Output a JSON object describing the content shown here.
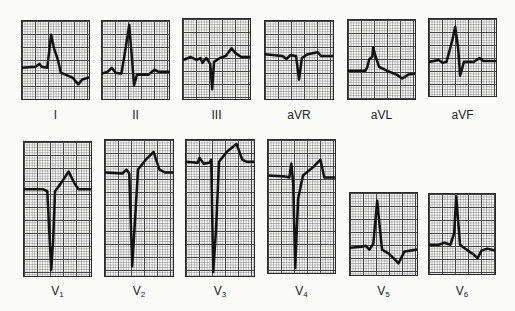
{
  "figure": {
    "trace_color": "#111111",
    "grid_color": "#444444"
  },
  "leads": [
    {
      "id": "I",
      "label": "I",
      "sub": "",
      "box": [
        21,
        20,
        69,
        80
      ],
      "label_y": 108,
      "trace": "0,48 14,47 18,44 20,47 26,48 30,14 33,28 37,40 40,53 52,58 58,65 62,60 69,58"
    },
    {
      "id": "II",
      "label": "II",
      "sub": "",
      "box": [
        101,
        20,
        69,
        80
      ],
      "label_y": 108,
      "trace": "0,54 6,52 10,48 14,53 20,54 24,30 28,4 31,40 33,66 36,55 48,55 54,50 58,52 69,52"
    },
    {
      "id": "III",
      "label": "III",
      "sub": "",
      "box": [
        182,
        18,
        69,
        82
      ],
      "label_y": 108,
      "trace": "0,42 8,39 14,42 18,40 20,45 24,40 28,46 30,72 32,44 38,40 44,38 50,30 54,35 60,39 69,39"
    },
    {
      "id": "aVR",
      "label": "aVR",
      "sub": "",
      "box": [
        264,
        20,
        70,
        80
      ],
      "label_y": 108,
      "trace": "0,34 18,36 22,39 26,35 32,36 35,60 38,38 44,34 54,32 58,36 70,36"
    },
    {
      "id": "aVL",
      "label": "aVL",
      "sub": "",
      "box": [
        347,
        19,
        69,
        81
      ],
      "label_y": 108,
      "trace": "0,52 18,52 20,48 22,40 25,38 26,28 28,36 32,48 40,52 50,56 56,60 62,56 69,55"
    },
    {
      "id": "aVF",
      "label": "aVF",
      "sub": "",
      "box": [
        428,
        18,
        69,
        79
      ],
      "label_y": 108,
      "trace": "0,44 10,42 14,45 18,44 24,22 27,8 30,30 32,58 36,44 46,44 52,40 56,43 69,43"
    },
    {
      "id": "V1",
      "label": "V",
      "sub": "1",
      "box": [
        23,
        141,
        69,
        136
      ],
      "label_y": 284,
      "trace": "0,48 14,48 20,48 24,50 28,130 30,100 32,50 38,42 46,30 52,42 56,48 69,48"
    },
    {
      "id": "V2",
      "label": "V",
      "sub": "2",
      "box": [
        104,
        139,
        70,
        138
      ],
      "label_y": 284,
      "trace": "0,33 18,34 22,30 25,34 28,128 31,80 34,30 42,20 50,12 56,30 62,33 70,33"
    },
    {
      "id": "V3",
      "label": "V",
      "sub": "3",
      "box": [
        185,
        139,
        70,
        138
      ],
      "label_y": 284,
      "trace": "0,22 12,23 14,18 18,24 24,23 26,20 28,134 31,90 34,22 42,12 52,4 58,20 62,22 70,22"
    },
    {
      "id": "V4",
      "label": "V",
      "sub": "4",
      "box": [
        267,
        139,
        69,
        135
      ],
      "label_y": 284,
      "trace": "0,36 18,37 22,38 24,24 26,44 28,130 31,60 36,36 46,28 54,20 58,38 69,38"
    },
    {
      "id": "V5",
      "label": "V",
      "sub": "5",
      "box": [
        349,
        192,
        69,
        84
      ],
      "label_y": 284,
      "trace": "0,56 12,55 16,54 20,58 24,52 28,8 33,58 40,62 46,68 50,72 56,60 69,58"
    },
    {
      "id": "V6",
      "label": "V",
      "sub": "6",
      "box": [
        428,
        193,
        68,
        82
      ],
      "label_y": 284,
      "trace": "0,52 10,52 16,50 22,52 26,40 28,2 32,52 40,58 46,62 50,66 54,58 60,56 68,58"
    }
  ]
}
